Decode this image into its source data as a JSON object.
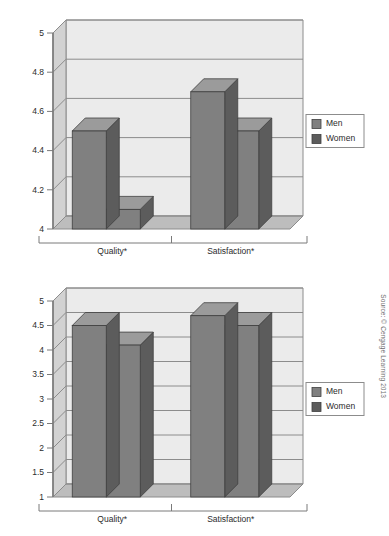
{
  "source_note": "Source: © Cengage Learning 2013",
  "palette": {
    "plot_bg": "#e6e6e6",
    "plot_bg_upper": "#ebebeb",
    "floor": "#bdbdbd",
    "wall_side": "#d2d2d2",
    "grid": "#8c8c8c",
    "bar_front": "#808080",
    "bar_top": "#9b9b9b",
    "bar_side": "#5c5c5c",
    "axis": "#7a7a7a",
    "text": "#2b2b2b",
    "legend_border": "#8c8c8c",
    "page_bg": "#ffffff"
  },
  "legend": {
    "entries": [
      {
        "label": "Men",
        "swatch_name": "men-swatch"
      },
      {
        "label": "Women",
        "swatch_name": "women-swatch"
      }
    ]
  },
  "chart_data": [
    {
      "id": "chart-top",
      "type": "bar",
      "title": "",
      "subtitle": "",
      "xlabel": "",
      "ylabel": "",
      "categories": [
        "Quality*",
        "Satisfaction*"
      ],
      "series": [
        {
          "name": "Men",
          "values": [
            4.5,
            4.7
          ]
        },
        {
          "name": "Women",
          "values": [
            4.1,
            4.5
          ]
        }
      ],
      "ylim": [
        4,
        5
      ],
      "yticks": [
        4,
        4.2,
        4.4,
        4.6,
        4.8,
        5
      ],
      "ytick_labels": [
        "4",
        "4.2",
        "4.4",
        "4.6",
        "4.8",
        "5"
      ],
      "grid": true,
      "legend_position": "right",
      "three_d": true,
      "annotations": []
    },
    {
      "id": "chart-bottom",
      "type": "bar",
      "title": "",
      "subtitle": "",
      "xlabel": "",
      "ylabel": "",
      "categories": [
        "Quality*",
        "Satisfaction*"
      ],
      "series": [
        {
          "name": "Men",
          "values": [
            4.5,
            4.7
          ]
        },
        {
          "name": "Women",
          "values": [
            4.1,
            4.5
          ]
        }
      ],
      "ylim": [
        1,
        5
      ],
      "yticks": [
        1,
        1.5,
        2,
        2.5,
        3,
        3.5,
        4,
        4.5,
        5
      ],
      "ytick_labels": [
        "1",
        "1.5",
        "2",
        "2.5",
        "3",
        "3.5",
        "4",
        "4.5",
        "5"
      ],
      "grid": true,
      "legend_position": "right",
      "three_d": true,
      "annotations": []
    }
  ]
}
